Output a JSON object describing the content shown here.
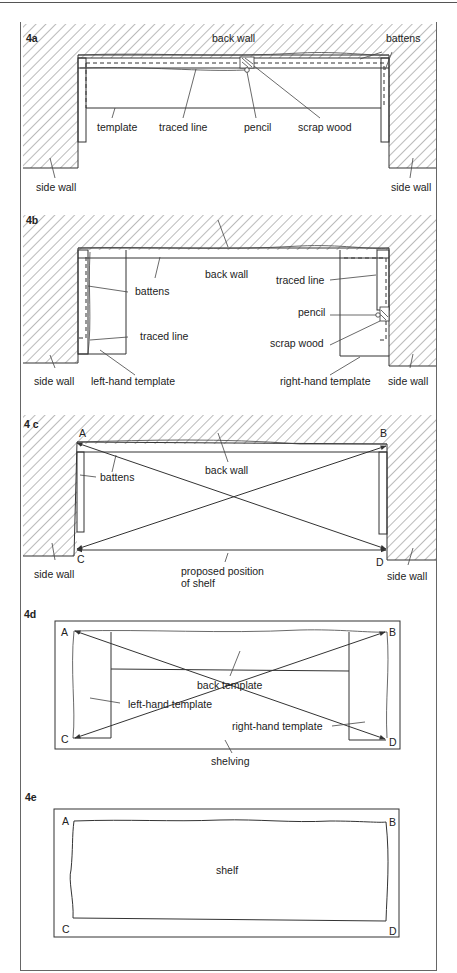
{
  "figure": {
    "panels": [
      {
        "id": "4a",
        "labels": {
          "back_wall": "back wall",
          "battens": "battens",
          "template": "template",
          "traced_line": "traced line",
          "pencil": "pencil",
          "scrap_wood": "scrap wood",
          "side_wall_left": "side wall",
          "side_wall_right": "side wall"
        }
      },
      {
        "id": "4b",
        "labels": {
          "back_wall": "back wall",
          "traced_line_right": "traced line",
          "battens": "battens",
          "pencil": "pencil",
          "traced_line_left": "traced line",
          "scrap_wood": "scrap wood",
          "side_wall_left": "side wall",
          "left_template": "left-hand template",
          "right_template": "right-hand template",
          "side_wall_right": "side wall"
        }
      },
      {
        "id": "4 c",
        "labels": {
          "corner_a": "A",
          "corner_b": "B",
          "corner_c": "C",
          "corner_d": "D",
          "back_wall": "back wall",
          "battens": "battens",
          "side_wall_left": "side wall",
          "side_wall_right": "side wall",
          "proposed_line1": "proposed position",
          "proposed_line2": "of shelf"
        }
      },
      {
        "id": "4d",
        "labels": {
          "corner_a": "A",
          "corner_b": "B",
          "corner_c": "C",
          "corner_d": "D",
          "back_template": "back template",
          "left_template": "left-hand template",
          "right_template": "right-hand template",
          "shelving": "shelving"
        }
      },
      {
        "id": "4e",
        "labels": {
          "corner_a": "A",
          "corner_b": "B",
          "corner_c": "C",
          "corner_d": "D",
          "shelf": "shelf"
        }
      }
    ]
  }
}
